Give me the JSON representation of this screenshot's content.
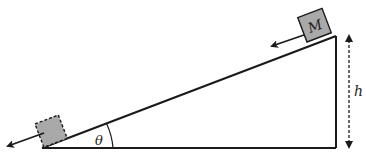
{
  "diagram": {
    "labels": {
      "mass": "M",
      "angle": "θ",
      "height": "h"
    },
    "colors": {
      "line": "#1a1a1a",
      "block_fill": "#a9a9a9",
      "background": "#ffffff"
    },
    "elements": [
      {
        "id": "incline",
        "type": "right-triangle",
        "description": "inclined plane with right angle at bottom-right"
      },
      {
        "id": "block-top",
        "type": "block",
        "label": "M",
        "position": "top of incline",
        "border": "solid"
      },
      {
        "id": "block-bottom",
        "type": "block",
        "label": "",
        "position": "bottom of incline",
        "border": "dashed"
      },
      {
        "id": "velocity-arrow-top",
        "type": "arrow",
        "direction": "down-slope"
      },
      {
        "id": "velocity-arrow-bottom",
        "type": "arrow",
        "direction": "down-slope"
      },
      {
        "id": "height-indicator",
        "type": "double-arrow",
        "style": "dashed",
        "label": "h"
      },
      {
        "id": "angle-arc",
        "type": "arc",
        "label": "θ"
      }
    ]
  }
}
